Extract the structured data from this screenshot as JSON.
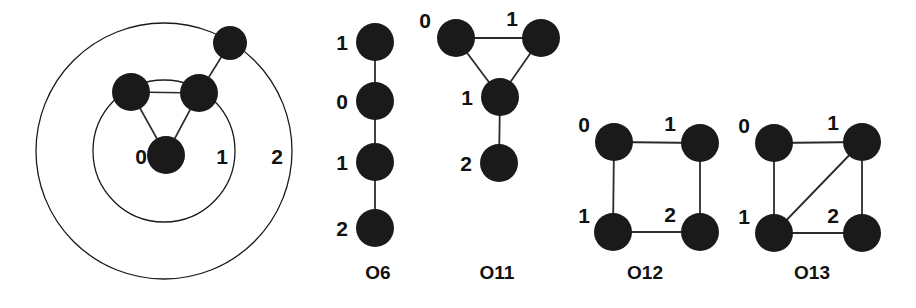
{
  "figure": {
    "background_color": "#ffffff",
    "ink_color": "#1a1a1a",
    "node_fill": "#1a1a1a",
    "edge_color": "#2b2b2b"
  },
  "concentric_diagram": {
    "name": "concentric-shell-diagram",
    "center": {
      "x": 164,
      "y": 151
    },
    "rings": [
      {
        "label": "0",
        "radius": 0,
        "label_x": 141,
        "label_y": 164
      },
      {
        "label": "1",
        "radius": 71,
        "label_x": 222,
        "label_y": 164
      },
      {
        "label": "2",
        "radius": 128,
        "label_x": 277,
        "label_y": 164
      }
    ],
    "nodes": [
      {
        "id": "center",
        "x": 166,
        "y": 155,
        "r": 19
      },
      {
        "id": "shell1-left",
        "x": 131,
        "y": 92,
        "r": 19
      },
      {
        "id": "shell1-right",
        "x": 199,
        "y": 93,
        "r": 19
      },
      {
        "id": "shell2-top",
        "x": 230,
        "y": 43,
        "r": 17
      }
    ],
    "edges": [
      {
        "from": "center",
        "to": "shell1-left"
      },
      {
        "from": "center",
        "to": "shell1-right"
      },
      {
        "from": "shell1-left",
        "to": "shell1-right"
      },
      {
        "from": "shell1-right",
        "to": "shell2-top"
      }
    ]
  },
  "graphs": [
    {
      "caption": "O6",
      "caption_x": 378,
      "caption_y": 279,
      "type": "path",
      "nodes": [
        {
          "label": "1",
          "x": 375,
          "y": 42,
          "r": 19,
          "label_x": 342,
          "label_y": 50
        },
        {
          "label": "0",
          "x": 375,
          "y": 101,
          "r": 19,
          "label_x": 342,
          "label_y": 109
        },
        {
          "label": "1",
          "x": 375,
          "y": 162,
          "r": 19,
          "label_x": 342,
          "label_y": 170
        },
        {
          "label": "2",
          "x": 375,
          "y": 228,
          "r": 19,
          "label_x": 342,
          "label_y": 236
        }
      ],
      "edges": [
        [
          0,
          1
        ],
        [
          1,
          2
        ],
        [
          2,
          3
        ]
      ]
    },
    {
      "caption": "O11",
      "caption_x": 497,
      "caption_y": 279,
      "type": "triangle-with-pendant",
      "nodes": [
        {
          "label": "0",
          "x": 456,
          "y": 38,
          "r": 19,
          "label_x": 425,
          "label_y": 28
        },
        {
          "label": "1",
          "x": 541,
          "y": 38,
          "r": 19,
          "label_x": 512,
          "label_y": 26
        },
        {
          "label": "1",
          "x": 500,
          "y": 97,
          "r": 19,
          "label_x": 467,
          "label_y": 105
        },
        {
          "label": "2",
          "x": 499,
          "y": 163,
          "r": 19,
          "label_x": 466,
          "label_y": 171
        }
      ],
      "edges": [
        [
          0,
          1
        ],
        [
          0,
          2
        ],
        [
          1,
          2
        ],
        [
          2,
          3
        ]
      ]
    },
    {
      "caption": "O12",
      "caption_x": 645,
      "caption_y": 279,
      "type": "cycle4",
      "nodes": [
        {
          "label": "0",
          "x": 614,
          "y": 142,
          "r": 19,
          "label_x": 584,
          "label_y": 132
        },
        {
          "label": "1",
          "x": 700,
          "y": 143,
          "r": 19,
          "label_x": 670,
          "label_y": 131
        },
        {
          "label": "1",
          "x": 613,
          "y": 232,
          "r": 19,
          "label_x": 584,
          "label_y": 223
        },
        {
          "label": "2",
          "x": 700,
          "y": 232,
          "r": 19,
          "label_x": 670,
          "label_y": 222
        }
      ],
      "edges": [
        [
          0,
          1
        ],
        [
          0,
          2
        ],
        [
          1,
          3
        ],
        [
          2,
          3
        ]
      ]
    },
    {
      "caption": "O13",
      "caption_x": 812,
      "caption_y": 279,
      "type": "cycle4-with-diagonal",
      "nodes": [
        {
          "label": "0",
          "x": 774,
          "y": 143,
          "r": 19,
          "label_x": 744,
          "label_y": 133
        },
        {
          "label": "1",
          "x": 862,
          "y": 142,
          "r": 19,
          "label_x": 833,
          "label_y": 130
        },
        {
          "label": "1",
          "x": 774,
          "y": 233,
          "r": 19,
          "label_x": 744,
          "label_y": 224
        },
        {
          "label": "2",
          "x": 862,
          "y": 233,
          "r": 19,
          "label_x": 833,
          "label_y": 223
        }
      ],
      "edges": [
        [
          0,
          1
        ],
        [
          0,
          2
        ],
        [
          1,
          3
        ],
        [
          2,
          3
        ],
        [
          1,
          2
        ]
      ]
    }
  ]
}
